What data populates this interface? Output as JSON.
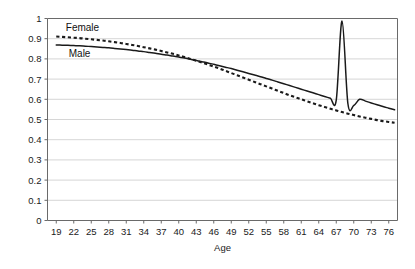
{
  "chart_data": {
    "type": "line",
    "title": "",
    "subtitle": "",
    "xlabel": "Age",
    "ylabel": "",
    "xlim": [
      17.5,
      77.5
    ],
    "ylim": [
      0,
      1
    ],
    "grid": true,
    "grid_axis": "y",
    "legend_position": "inline-annotation",
    "x_tick_labels": [
      "19",
      "22",
      "25",
      "28",
      "31",
      "34",
      "37",
      "40",
      "43",
      "46",
      "49",
      "52",
      "55",
      "58",
      "61",
      "64",
      "67",
      "70",
      "73",
      "76"
    ],
    "x_tick_values": [
      19,
      22,
      25,
      28,
      31,
      34,
      37,
      40,
      43,
      46,
      49,
      52,
      55,
      58,
      61,
      64,
      67,
      70,
      73,
      76
    ],
    "y_tick_labels": [
      "0",
      "0.1",
      "0.2",
      "0.3",
      "0.4",
      "0.5",
      "0.6",
      "0.7",
      "0.8",
      "0.9",
      "1"
    ],
    "y_tick_values": [
      0,
      0.1,
      0.2,
      0.3,
      0.4,
      0.5,
      0.6,
      0.7,
      0.8,
      0.9,
      1
    ],
    "x": [
      19,
      20,
      21,
      22,
      23,
      24,
      25,
      26,
      27,
      28,
      29,
      30,
      31,
      32,
      33,
      34,
      35,
      36,
      37,
      38,
      39,
      40,
      41,
      42,
      43,
      44,
      45,
      46,
      47,
      48,
      49,
      50,
      51,
      52,
      53,
      54,
      55,
      56,
      57,
      58,
      59,
      60,
      61,
      62,
      63,
      64,
      65,
      66,
      67,
      68,
      69,
      70,
      71,
      72,
      73,
      74,
      75,
      76,
      77
    ],
    "series": [
      {
        "name": "Female",
        "style": "dashed",
        "color": "#1a1a1a",
        "values": [
          0.911,
          0.909,
          0.907,
          0.905,
          0.903,
          0.9,
          0.897,
          0.894,
          0.891,
          0.887,
          0.883,
          0.879,
          0.874,
          0.869,
          0.864,
          0.858,
          0.852,
          0.846,
          0.839,
          0.832,
          0.825,
          0.817,
          0.809,
          0.8,
          0.791,
          0.782,
          0.772,
          0.762,
          0.752,
          0.741,
          0.73,
          0.719,
          0.708,
          0.697,
          0.686,
          0.675,
          0.664,
          0.653,
          0.642,
          0.631,
          0.62,
          0.61,
          0.6,
          0.59,
          0.58,
          0.571,
          0.562,
          0.553,
          0.545,
          0.537,
          0.529,
          0.522,
          0.515,
          0.509,
          0.503,
          0.497,
          0.492,
          0.488,
          0.484
        ]
      },
      {
        "name": "Male",
        "style": "solid",
        "color": "#1a1a1a",
        "values": [
          0.869,
          0.868,
          0.867,
          0.866,
          0.865,
          0.863,
          0.861,
          0.859,
          0.857,
          0.855,
          0.852,
          0.849,
          0.846,
          0.843,
          0.839,
          0.836,
          0.832,
          0.828,
          0.823,
          0.819,
          0.814,
          0.809,
          0.804,
          0.798,
          0.792,
          0.786,
          0.78,
          0.773,
          0.766,
          0.759,
          0.752,
          0.744,
          0.736,
          0.728,
          0.72,
          0.712,
          0.703,
          0.695,
          0.686,
          0.677,
          0.668,
          0.659,
          0.65,
          0.641,
          0.632,
          0.623,
          0.614,
          0.605,
          0.596,
          0.987,
          0.578,
          0.569,
          0.6,
          0.591,
          0.582,
          0.573,
          0.564,
          0.556,
          0.548
        ]
      }
    ],
    "annotations": [
      {
        "text": "Female",
        "x": 23.5,
        "y": 0.955,
        "name": "female-series-label"
      },
      {
        "text": "Male",
        "x": 23.0,
        "y": 0.828,
        "name": "male-series-label"
      }
    ],
    "colors": {
      "axis": "#555555",
      "grid": "#cccccc",
      "text": "#1a1a1a",
      "plot_background": "#ffffff",
      "page_background": "#ffffff"
    }
  }
}
